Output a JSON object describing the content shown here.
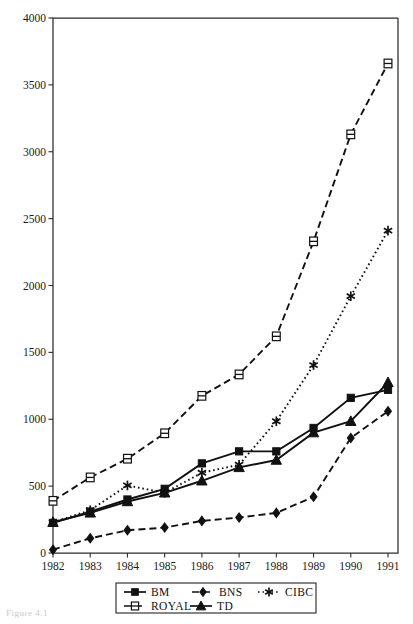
{
  "caption": "Figure 4.1",
  "chart_data": {
    "type": "line",
    "title": "",
    "xlabel": "",
    "ylabel": "",
    "categories": [
      "1982",
      "1983",
      "1984",
      "1985",
      "1986",
      "1987",
      "1988",
      "1989",
      "1990",
      "1991"
    ],
    "x": [
      1982,
      1983,
      1984,
      1985,
      1986,
      1987,
      1988,
      1989,
      1990,
      1991
    ],
    "xlim": [
      1982,
      1991
    ],
    "ylim": [
      0,
      4000
    ],
    "ytick_step": 500,
    "yticks": [
      "0",
      "500",
      "1000",
      "1500",
      "2000",
      "2500",
      "3000",
      "3500",
      "4000"
    ],
    "grid": false,
    "legend_position": "bottom",
    "series": [
      {
        "name": "BM",
        "marker": "filled-square",
        "dash": "solid",
        "color": "#111111",
        "values": [
          225,
          310,
          400,
          480,
          670,
          760,
          760,
          935,
          1160,
          1220
        ]
      },
      {
        "name": "BNS",
        "marker": "filled-diamond",
        "dash": "dashed",
        "color": "#111111",
        "values": [
          25,
          110,
          170,
          190,
          240,
          265,
          300,
          420,
          860,
          1060
        ]
      },
      {
        "name": "CIBC",
        "marker": "asterisk",
        "dash": "dotted",
        "color": "#111111",
        "values": [
          230,
          320,
          505,
          450,
          600,
          660,
          985,
          1405,
          1920,
          2410
        ]
      },
      {
        "name": "ROYAL",
        "marker": "open-square",
        "dash": "dashed",
        "color": "#111111",
        "values": [
          390,
          565,
          705,
          895,
          1175,
          1335,
          1620,
          2330,
          3130,
          3660
        ]
      },
      {
        "name": "TD",
        "marker": "filled-triangle",
        "dash": "solid",
        "color": "#111111",
        "values": [
          230,
          300,
          385,
          450,
          540,
          640,
          695,
          900,
          985,
          1275
        ]
      }
    ]
  },
  "legend": {
    "rows": [
      [
        "BM",
        "BNS",
        "CIBC"
      ],
      [
        "ROYAL",
        "TD"
      ]
    ]
  }
}
